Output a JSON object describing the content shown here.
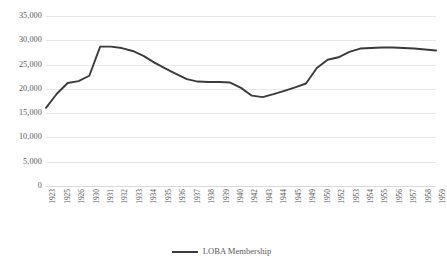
{
  "chart_data": {
    "type": "line",
    "title": "",
    "xlabel": "",
    "ylabel": "",
    "ylim": [
      0,
      35000
    ],
    "yticks": [
      0,
      5000,
      10000,
      15000,
      20000,
      25000,
      30000,
      35000
    ],
    "ytick_labels": [
      "0",
      "5,000",
      "10,000",
      "15,000",
      "20,000",
      "25,000",
      "30,000",
      "35,000"
    ],
    "grid": true,
    "legend_position": "bottom-center",
    "series": [
      {
        "name": "LOBA Membership",
        "color": "#3b3b3b",
        "values": [
          16100,
          19000,
          21200,
          21600,
          22700,
          28700,
          28700,
          28400,
          27800,
          26800,
          25400,
          24200,
          23100,
          22000,
          21500,
          21400,
          21400,
          21300,
          20200,
          18600,
          18300,
          18900,
          19600,
          20300,
          21100,
          24300,
          26000,
          26500,
          27600,
          28300,
          28400,
          28500,
          28500,
          28400,
          28300,
          28100,
          27900
        ]
      }
    ],
    "categories": [
      "1923",
      "1924",
      "1925",
      "1926",
      "1930",
      "1931",
      "1932",
      "1933",
      "1934",
      "1935",
      "1936",
      "1937",
      "1938",
      "1939",
      "1940",
      "1941",
      "1942",
      "1943",
      "1944",
      "1945",
      "1946",
      "1947",
      "1948",
      "1949",
      "1950",
      "1951",
      "1952",
      "1953",
      "1954",
      "1955",
      "1956",
      "1957",
      "1958",
      "1959",
      "1960",
      "1961",
      "1962"
    ],
    "xtick_labels": [
      "1923",
      "1925",
      "1926",
      "1930",
      "1931",
      "1932",
      "1933",
      "1934",
      "1935",
      "1936",
      "1937",
      "1938",
      "1939",
      "1940",
      "1942",
      "1943",
      "1944",
      "1945",
      "1949",
      "1950",
      "1952",
      "1953",
      "1954",
      "1955",
      "1956",
      "1957",
      "1958",
      "1959"
    ],
    "x": [
      "1923",
      "1925",
      "1926",
      "1930",
      "1931",
      "1932",
      "1933",
      "1934",
      "1935",
      "1936",
      "1937",
      "1938",
      "1939",
      "1940",
      "1942",
      "1943",
      "1944",
      "1945",
      "1949",
      "1950",
      "1952",
      "1953",
      "1954",
      "1955",
      "1956",
      "1957",
      "1958",
      "1959"
    ]
  },
  "legend": {
    "entries": [
      {
        "label": "LOBA Membership",
        "color": "#3b3b3b"
      }
    ]
  }
}
